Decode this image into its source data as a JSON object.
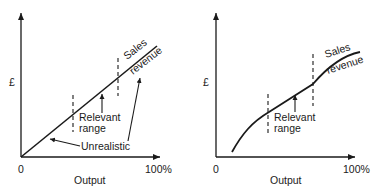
{
  "graphs": [
    {
      "id": "linear",
      "y_label": "£",
      "x_label": "Output",
      "x_start": "0",
      "x_end": "100%",
      "curve_label_1": "Sales",
      "curve_label_2": "revenue",
      "range_label_1": "Relevant",
      "range_label_2": "range",
      "annotation": "Unrealistic"
    },
    {
      "id": "curved",
      "y_label": "£",
      "x_label": "Output",
      "x_start": "0",
      "x_end": "100%",
      "curve_label_1": "Sales",
      "curve_label_2": "revenue",
      "range_label_1": "Relevant",
      "range_label_2": "range"
    }
  ],
  "colors": {
    "ink": "#1a1a1a",
    "background": "#ffffff"
  }
}
